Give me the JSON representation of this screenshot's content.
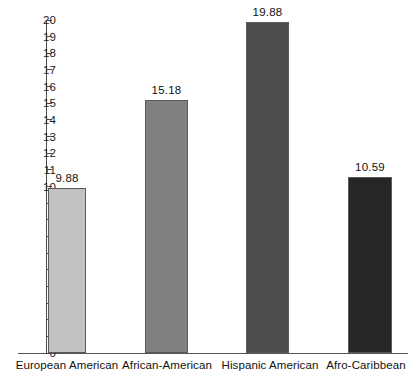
{
  "chart_data": {
    "type": "bar",
    "title": "",
    "subtitle": "",
    "xlabel": "",
    "ylabel": "",
    "ylim": [
      0,
      20
    ],
    "yticks": [
      0,
      1,
      2,
      3,
      4,
      5,
      6,
      7,
      8,
      9,
      10,
      11,
      12,
      13,
      14,
      15,
      16,
      17,
      18,
      19,
      20
    ],
    "ytick_labels": [
      "0",
      "1",
      "2",
      "3",
      "4",
      "5",
      "6",
      "7",
      "8",
      "9",
      "10",
      "11",
      "12",
      "13",
      "14",
      "15",
      "16",
      "17",
      "18",
      "19",
      "20"
    ],
    "grid": false,
    "legend": "none",
    "categories": [
      "European American",
      "African-American",
      "Hispanic American",
      "Afro-Caribbean"
    ],
    "values": [
      9.88,
      15.18,
      19.88,
      10.59
    ],
    "value_labels": [
      "9.88",
      "15.18",
      "19.88",
      "10.59"
    ],
    "bar_colors": [
      "#c2c2c2",
      "#808080",
      "#4d4d4d",
      "#262626"
    ],
    "bar_border_color": "#5a5a5a",
    "axis_color": "#4a4a4a",
    "background": "#ffffff",
    "text_color": "#111111",
    "bars": [
      {
        "category": "European American",
        "value": 9.88,
        "label": "9.88",
        "color": "#c2c2c2"
      },
      {
        "category": "African-American",
        "value": 15.18,
        "label": "15.18",
        "color": "#808080"
      },
      {
        "category": "Hispanic American",
        "value": 19.88,
        "label": "19.88",
        "color": "#4d4d4d"
      },
      {
        "category": "Afro-Caribbean",
        "value": 10.59,
        "label": "10.59",
        "color": "#262626"
      }
    ]
  }
}
